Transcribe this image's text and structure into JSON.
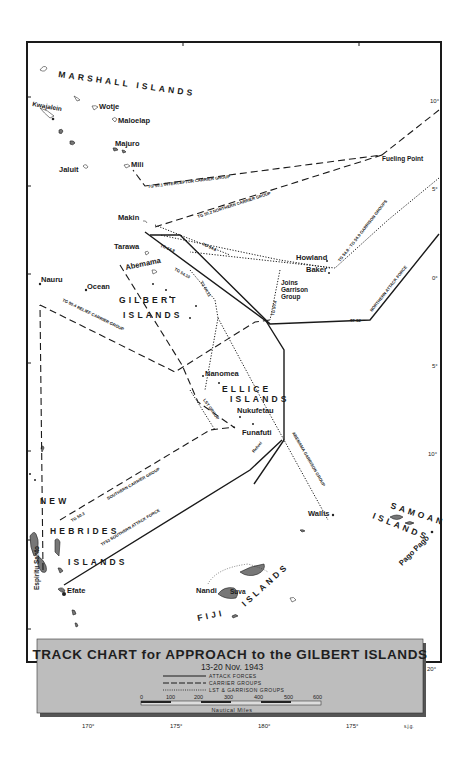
{
  "map": {
    "legend": {
      "title": "TRACK CHART for APPROACH to the GILBERT ISLANDS",
      "date": "13-20 Nov. 1943",
      "keys": [
        {
          "style": "solid",
          "label": "ATTACK FORCES"
        },
        {
          "style": "dashed",
          "label": "CARRIER GROUPS"
        },
        {
          "style": "dotted",
          "label": "LST & GARRISON GROUPS"
        }
      ],
      "scale": {
        "ticks": [
          "0",
          "100",
          "200",
          "300",
          "400",
          "500",
          "600"
        ],
        "unit": "Nautical Miles"
      },
      "background_color": "#bdbdbd"
    },
    "longitude_labels": [
      "170°",
      "175°",
      "180°",
      "175°"
    ],
    "latitude_labels": [
      "10°",
      "5°",
      "0°",
      "5°",
      "10°",
      "20°"
    ],
    "credit": "s.j.g.",
    "regions": {
      "marshall": "MARSHALL ISLANDS",
      "gilbert_1": "GILBERT",
      "gilbert_2": "ISLANDS",
      "ellice_1": "ELLICE",
      "ellice_2": "ISLANDS",
      "newheb_1": "NEW",
      "newheb_2": "HEBRIDES",
      "newheb_3": "ISLANDS",
      "samoan_1": "SAMOAN",
      "samoan_2": "ISLANDS",
      "fiji_1": "FIJI",
      "fiji_2": "ISLANDS"
    },
    "places": {
      "kwajalein": "Kwajalein",
      "wotje": "Wotje",
      "maloelap": "Maloelap",
      "majuro": "Majuro",
      "mili": "Mili",
      "jaluit": "Jaluit",
      "fueling_point": "Fueling Point",
      "makin": "Makin",
      "tarawa": "Tarawa",
      "abemama": "Abemama",
      "howland": "Howland",
      "baker": "Baker",
      "joins_1": "Joins",
      "joins_2": "Garrison",
      "joins_3": "Group",
      "nauru": "Nauru",
      "ocean": "Ocean",
      "nanomea": "Nanomea",
      "nukufetau": "Nukufetau",
      "funafuti": "Funafuti",
      "wallis": "Wallis",
      "espiritu_santo": "Espiritu Santo",
      "efate": "Efate",
      "nandi": "Nandi",
      "suva": "Suva",
      "pago_pago": "Pago Pago"
    },
    "tracks": {
      "tg501": "TG 50.1 INTERCEPTOR CARRIER GROUP",
      "tg502": "TG 50.2 NORTHERN CARRIER GROUP",
      "tg548": "TG 54.8 - TG 54.9 GARRISON GROUPS",
      "tf52": "TF 52",
      "northern_attack": "NORTHERN ATTACK FORCE",
      "tg504": "TG 50.4 RELIEF CARRIER GROUP",
      "tg503": "TG 50.3",
      "southern_carrier": "SOUTHERN CARRIER GROUP",
      "tf53": "TF53 SOUTHERN ATTACK FORCE",
      "refuel": "Refuel",
      "abemama_garrison": "ABEMAMA GARRISON GROUP",
      "tg5410": "TG 54.10",
      "tg5411": "TG 54.11",
      "tg5460": "TG 54.6",
      "tg549b": "TG 54.9",
      "tg5040b": "TG 50.4",
      "lst_group": "LST GROUP"
    }
  }
}
